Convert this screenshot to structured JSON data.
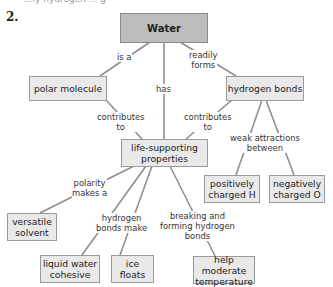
{
  "question": {
    "number": "2.",
    "cut_off_text": "...ly hydrogen ... g"
  },
  "colors": {
    "root_fill": "#bdbdbd",
    "node_fill": "#e9e9e9",
    "border": "#9a9a9a",
    "line": "#8f8f8f"
  },
  "nodes": {
    "water": "Water",
    "polar_molecule": "polar molecule",
    "hydrogen_bonds": "hydrogen bonds",
    "life_supporting_l1": "life-supporting",
    "life_supporting_l2": "properties",
    "pos_h_l1": "positively",
    "pos_h_l2": "charged H",
    "neg_o_l1": "negatively",
    "neg_o_l2": "charged O",
    "versatile_l1": "versatile",
    "versatile_l2": "solvent",
    "cohesive_l1": "liquid water",
    "cohesive_l2": "cohesive",
    "ice_l1": "ice",
    "ice_l2": "floats",
    "moderate_l1": "help moderate",
    "moderate_l2": "temperature"
  },
  "links": {
    "is_a": "is a",
    "readily_forms_l1": "readily",
    "readily_forms_l2": "forms",
    "has": "has",
    "contributes_left_l1": "contributes",
    "contributes_left_l2": "to",
    "contributes_right_l1": "contributes",
    "contributes_right_l2": "to",
    "weak_l1": "weak attractions",
    "weak_l2": "between",
    "polarity_l1": "polarity",
    "polarity_l2": "makes a",
    "hbonds_make_l1": "hydrogen",
    "hbonds_make_l2": "bonds make",
    "breaking_l1": "breaking and",
    "breaking_l2": "forming hydrogen",
    "breaking_l3": "bonds"
  }
}
